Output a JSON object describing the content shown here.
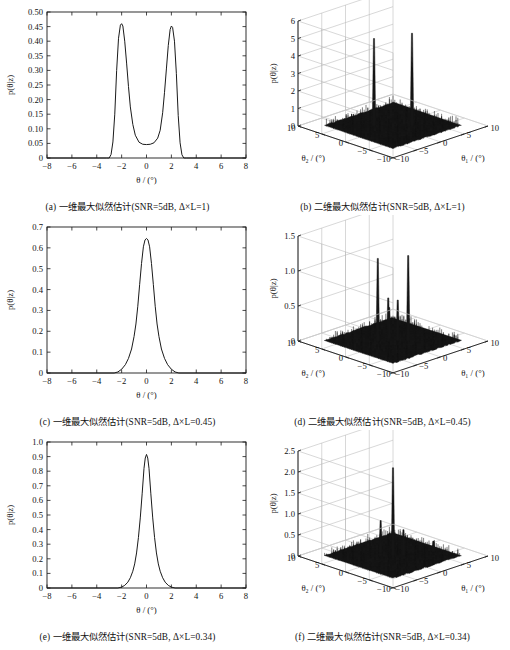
{
  "figure": {
    "title": "",
    "panel_count": 6,
    "layout": "3 rows x 2 columns"
  },
  "chart_data": [
    {
      "id": "a",
      "type": "line",
      "title": "(a) 一维最大似然估计(SNR=5dB, Δ×L=1)",
      "caption": "(a) 一维最大似然估计(SNR=5dB, Δ×L=1)",
      "xlabel": "θ / (°)",
      "ylabel": "p(θ|z)",
      "xlim": [
        -8,
        8
      ],
      "ylim": [
        0,
        0.5
      ],
      "xticks": [
        -8,
        -6,
        -4,
        -2,
        0,
        2,
        4,
        6,
        8
      ],
      "xticklabels": [
        "−8",
        "−6",
        "−4",
        "−2",
        "0",
        "2",
        "4",
        "6",
        "8"
      ],
      "yticks": [
        0,
        0.05,
        0.1,
        0.15,
        0.2,
        0.25,
        0.3,
        0.35,
        0.4,
        0.45,
        0.5
      ],
      "yticklabels": [
        "0",
        "0.05",
        "0.10",
        "0.15",
        "0.20",
        "0.25",
        "0.30",
        "0.35",
        "0.40",
        "0.45",
        "0.50"
      ],
      "grid": false,
      "peaks": [
        {
          "x": -2.0,
          "y": 0.46
        },
        {
          "x": 2.0,
          "y": 0.452
        }
      ],
      "valley": {
        "x": 0.1,
        "y": 0.046
      },
      "x": [
        -8.0,
        -3.2,
        -3.0,
        -2.85,
        -2.7,
        -2.55,
        -2.4,
        -2.25,
        -2.1,
        -2.0,
        -1.9,
        -1.75,
        -1.6,
        -1.45,
        -1.3,
        -1.1,
        -0.9,
        -0.6,
        -0.3,
        0.0,
        0.3,
        0.6,
        0.9,
        1.1,
        1.3,
        1.45,
        1.6,
        1.75,
        1.9,
        2.0,
        2.1,
        2.25,
        2.4,
        2.55,
        2.7,
        2.85,
        3.0,
        3.2,
        8.0
      ],
      "values": [
        0.0,
        0.0,
        0.0,
        0.012,
        0.055,
        0.15,
        0.3,
        0.41,
        0.455,
        0.46,
        0.452,
        0.4,
        0.325,
        0.245,
        0.175,
        0.115,
        0.078,
        0.054,
        0.047,
        0.046,
        0.047,
        0.052,
        0.068,
        0.095,
        0.155,
        0.225,
        0.305,
        0.385,
        0.44,
        0.452,
        0.447,
        0.4,
        0.29,
        0.145,
        0.052,
        0.011,
        0.0,
        0.0,
        0.0
      ]
    },
    {
      "id": "b",
      "type": "surface",
      "title": "(b) 二维最大似然估计(SNR=5dB, Δ×L=1)",
      "caption": "(b) 二维最大似然估计(SNR=5dB, Δ×L=1)",
      "xlabel": "θ₁ / (°)",
      "ylabel": "θ₂ / (°)",
      "zlabel": "p(θ|z)",
      "xlim": [
        -10,
        10
      ],
      "ylim": [
        -10,
        10
      ],
      "zlim": [
        0,
        6
      ],
      "xticks": [
        -10,
        -5,
        0,
        5,
        10
      ],
      "xticklabels": [
        "−10",
        "−5",
        "0",
        "5",
        "10"
      ],
      "yticks": [
        -10,
        -5,
        0,
        5,
        10
      ],
      "yticklabels": [
        "−10",
        "−5",
        "0",
        "5",
        "10"
      ],
      "zticks": [
        0,
        1,
        2,
        3,
        4,
        5,
        6
      ],
      "zticklabels": [
        "0",
        "1",
        "2",
        "3",
        "4",
        "5",
        "6"
      ],
      "grid": true,
      "spikes": [
        {
          "x": -2.0,
          "y": 2.0,
          "z": 5.0
        },
        {
          "x": 2.0,
          "y": -2.0,
          "z": 5.3
        }
      ],
      "floor_noise": "dense dark speckle across central plateau"
    },
    {
      "id": "c",
      "type": "line",
      "title": "(c) 一维最大似然估计(SNR=5dB, Δ×L=0.45)",
      "caption": "(c) 一维最大似然估计(SNR=5dB, Δ×L=0.45)",
      "xlabel": "θ / (°)",
      "ylabel": "p(θ|z)",
      "xlim": [
        -8,
        8
      ],
      "ylim": [
        0,
        0.7
      ],
      "xticks": [
        -8,
        -6,
        -4,
        -2,
        0,
        2,
        4,
        6,
        8
      ],
      "xticklabels": [
        "−8",
        "−6",
        "−4",
        "−2",
        "0",
        "2",
        "4",
        "6",
        "8"
      ],
      "yticks": [
        0,
        0.1,
        0.2,
        0.3,
        0.4,
        0.5,
        0.6,
        0.7
      ],
      "yticklabels": [
        "0",
        "0.1",
        "0.2",
        "0.3",
        "0.4",
        "0.5",
        "0.6",
        "0.7"
      ],
      "grid": false,
      "peaks": [
        {
          "x": 0.0,
          "y": 0.645
        }
      ],
      "x": [
        -8.0,
        -2.6,
        -2.3,
        -2.0,
        -1.7,
        -1.45,
        -1.2,
        -1.0,
        -0.85,
        -0.7,
        -0.55,
        -0.4,
        -0.25,
        -0.12,
        0.0,
        0.12,
        0.25,
        0.4,
        0.55,
        0.7,
        0.85,
        1.0,
        1.2,
        1.45,
        1.7,
        2.0,
        2.3,
        2.6,
        8.0
      ],
      "values": [
        0.0,
        0.0,
        0.005,
        0.018,
        0.04,
        0.07,
        0.115,
        0.175,
        0.235,
        0.32,
        0.425,
        0.525,
        0.605,
        0.638,
        0.645,
        0.638,
        0.605,
        0.525,
        0.425,
        0.32,
        0.235,
        0.175,
        0.115,
        0.07,
        0.04,
        0.018,
        0.005,
        0.0,
        0.0
      ]
    },
    {
      "id": "d",
      "type": "surface",
      "title": "(d) 二维最大似然估计(SNR=5dB, Δ×L=0.45)",
      "caption": "(d) 二维最大似然估计(SNR=5dB, Δ×L=0.45)",
      "xlabel": "θ₁ / (°)",
      "ylabel": "θ₂ / (°)",
      "zlabel": "p(θ|z)",
      "xlim": [
        -10,
        10
      ],
      "ylim": [
        -10,
        10
      ],
      "zlim": [
        0,
        1.5
      ],
      "xticks": [
        -10,
        -5,
        0,
        5,
        10
      ],
      "xticklabels": [
        "−10",
        "−5",
        "0",
        "5",
        "10"
      ],
      "yticks": [
        -10,
        -5,
        0,
        5,
        10
      ],
      "yticklabels": [
        "−10",
        "−5",
        "0",
        "5",
        "10"
      ],
      "zticks": [
        0,
        0.5,
        1.0,
        1.5
      ],
      "zticklabels": [
        "0",
        "0.5",
        "1.0",
        "1.5"
      ],
      "grid": true,
      "spikes": [
        {
          "x": -1.6,
          "y": 1.6,
          "z": 1.18
        },
        {
          "x": 1.6,
          "y": -1.6,
          "z": 1.22
        },
        {
          "x": -0.6,
          "y": 0.4,
          "z": 0.62
        },
        {
          "x": 0.6,
          "y": -0.4,
          "z": 0.58
        },
        {
          "x": 0.2,
          "y": 1.0,
          "z": 0.45
        }
      ],
      "floor_noise": "dense dark speckle across central plateau"
    },
    {
      "id": "e",
      "type": "line",
      "title": "(e) 一维最大似然估计(SNR=5dB, Δ×L=0.34)",
      "caption": "(e) 一维最大似然估计(SNR=5dB, Δ×L=0.34)",
      "xlabel": "θ / (°)",
      "ylabel": "p(θ|z)",
      "xlim": [
        -8,
        8
      ],
      "ylim": [
        0,
        1.0
      ],
      "xticks": [
        -8,
        -6,
        -4,
        -2,
        0,
        2,
        4,
        6,
        8
      ],
      "xticklabels": [
        "−8",
        "−6",
        "−4",
        "−2",
        "0",
        "2",
        "4",
        "6",
        "8"
      ],
      "yticks": [
        0,
        0.1,
        0.2,
        0.3,
        0.4,
        0.5,
        0.6,
        0.7,
        0.8,
        0.9,
        1.0
      ],
      "yticklabels": [
        "0",
        "0.1",
        "0.2",
        "0.3",
        "0.4",
        "0.5",
        "0.6",
        "0.7",
        "0.8",
        "0.9",
        "1.0"
      ],
      "grid": false,
      "peaks": [
        {
          "x": 0.0,
          "y": 0.915
        }
      ],
      "x": [
        -8.0,
        -2.3,
        -2.0,
        -1.75,
        -1.5,
        -1.3,
        -1.1,
        -0.95,
        -0.8,
        -0.65,
        -0.5,
        -0.35,
        -0.2,
        -0.1,
        0.0,
        0.1,
        0.2,
        0.35,
        0.5,
        0.65,
        0.8,
        0.95,
        1.1,
        1.3,
        1.5,
        1.75,
        2.0,
        2.3,
        8.0
      ],
      "values": [
        0.0,
        0.0,
        0.006,
        0.018,
        0.04,
        0.07,
        0.115,
        0.165,
        0.24,
        0.345,
        0.48,
        0.645,
        0.82,
        0.89,
        0.915,
        0.89,
        0.82,
        0.645,
        0.48,
        0.345,
        0.24,
        0.165,
        0.115,
        0.07,
        0.04,
        0.018,
        0.006,
        0.0,
        0.0
      ]
    },
    {
      "id": "f",
      "type": "surface",
      "title": "(f) 二维最大似然估计(SNR=5dB, Δ×L=0.34)",
      "caption": "(f) 二维最大似然估计(SNR=5dB, Δ×L=0.34)",
      "xlabel": "θ₁ / (°)",
      "ylabel": "θ₂ / (°)",
      "zlabel": "p(θ|z)",
      "xlim": [
        -10,
        10
      ],
      "ylim": [
        -10,
        10
      ],
      "zlim": [
        0,
        2.5
      ],
      "xticks": [
        -10,
        -5,
        0,
        5,
        10
      ],
      "xticklabels": [
        "−10",
        "−5",
        "0",
        "5",
        "10"
      ],
      "yticks": [
        -10,
        -5,
        0,
        5,
        10
      ],
      "yticklabels": [
        "−10",
        "−5",
        "0",
        "5",
        "10"
      ],
      "zticks": [
        0,
        0.5,
        1.0,
        1.5,
        2.0,
        2.5
      ],
      "zticklabels": [
        "0",
        "0.5",
        "1.0",
        "1.5",
        "2.0",
        "2.5"
      ],
      "grid": true,
      "spikes": [
        {
          "x": 0.0,
          "y": 0.0,
          "z": 2.1
        },
        {
          "x": -1.4,
          "y": 1.2,
          "z": 0.85
        },
        {
          "x": 1.2,
          "y": -1.0,
          "z": 0.62
        },
        {
          "x": -0.4,
          "y": 2.2,
          "z": 0.45
        },
        {
          "x": -6.5,
          "y": 3.0,
          "z": 0.28
        },
        {
          "x": 5.5,
          "y": -3.0,
          "z": 0.26
        }
      ],
      "floor_noise": "dense dark speckle across central plateau"
    }
  ],
  "style": {
    "line_color": "#1a1a1a",
    "axis_color": "#1a1a1a",
    "grid_color": "#b8b8b8",
    "surface_color": "#151515",
    "background": "#ffffff"
  }
}
